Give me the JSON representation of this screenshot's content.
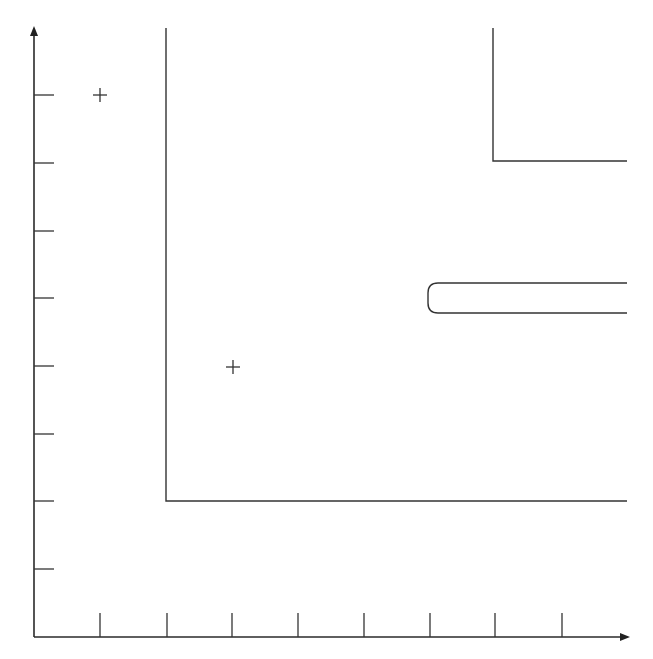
{
  "diagram": {
    "type": "coordinate-grid-drawing",
    "colors": {
      "background": "#ffffff",
      "stroke": "#333333"
    },
    "axes": {
      "origin": [
        34,
        637
      ],
      "y_axis": {
        "x": 34,
        "top": 26,
        "bottom": 637,
        "arrow": "up"
      },
      "x_axis": {
        "y": 637,
        "left": 34,
        "right": 630,
        "arrow": "right"
      },
      "y_ticks": [
        95,
        163,
        231,
        298,
        366,
        434,
        501,
        569
      ],
      "y_tick_length": 20,
      "x_ticks": [
        100,
        167,
        232,
        298,
        364,
        430,
        495,
        562
      ],
      "x_tick_length": 24
    },
    "shapes": [
      {
        "name": "large-l-shape",
        "points": [
          [
            166,
            28
          ],
          [
            166,
            501
          ],
          [
            627,
            501
          ]
        ]
      },
      {
        "name": "small-l-shape",
        "points": [
          [
            493,
            28
          ],
          [
            493,
            161
          ],
          [
            627,
            161
          ]
        ]
      },
      {
        "name": "rounded-slot",
        "left": 428,
        "top": 283,
        "bottom": 313,
        "right": 627,
        "radius": 10
      }
    ],
    "markers": [
      {
        "name": "plus-marker-1",
        "x": 100,
        "y": 95,
        "size": 7
      },
      {
        "name": "plus-marker-2",
        "x": 233,
        "y": 367,
        "size": 7
      }
    ]
  }
}
